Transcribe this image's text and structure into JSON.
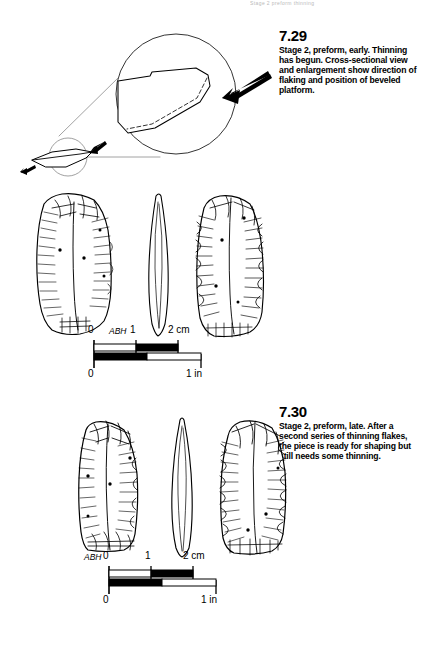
{
  "page": {
    "running_head": "Stage 2 preform thinning",
    "background_color": "#ffffff",
    "ink_color": "#000000"
  },
  "figures": [
    {
      "id": "7.29",
      "number": "7.29",
      "caption": "Stage 2, preform, early. Thinning has begun. Cross-sectional view and enlargement show direction of flaking and position of beveled platform.",
      "artist_signature": "ABH",
      "views": [
        "obverse face",
        "edge profile",
        "reverse face"
      ],
      "inset": {
        "type": "cross-section with magnified detail circle",
        "arrows": 3,
        "large_arrow_direction": "down-left",
        "small_arrow_count": 2
      },
      "scale": {
        "metric_labels": [
          "0",
          "1",
          "2 cm"
        ],
        "imperial_labels": [
          "0",
          "1 in"
        ],
        "metric_unit": "cm",
        "imperial_unit": "in",
        "metric_max": 2,
        "imperial_max": 1
      }
    },
    {
      "id": "7.30",
      "number": "7.30",
      "caption": "Stage 2, preform, late. After a second series of thinning flakes, the piece is ready for shaping but still needs some thinning.",
      "artist_signature": "ABH",
      "views": [
        "obverse face",
        "edge profile",
        "reverse face"
      ],
      "inset": null,
      "scale": {
        "metric_labels": [
          "0",
          "1",
          "2 cm"
        ],
        "imperial_labels": [
          "0",
          "1 in"
        ],
        "metric_unit": "cm",
        "imperial_unit": "in",
        "metric_max": 2,
        "imperial_max": 1
      }
    }
  ]
}
